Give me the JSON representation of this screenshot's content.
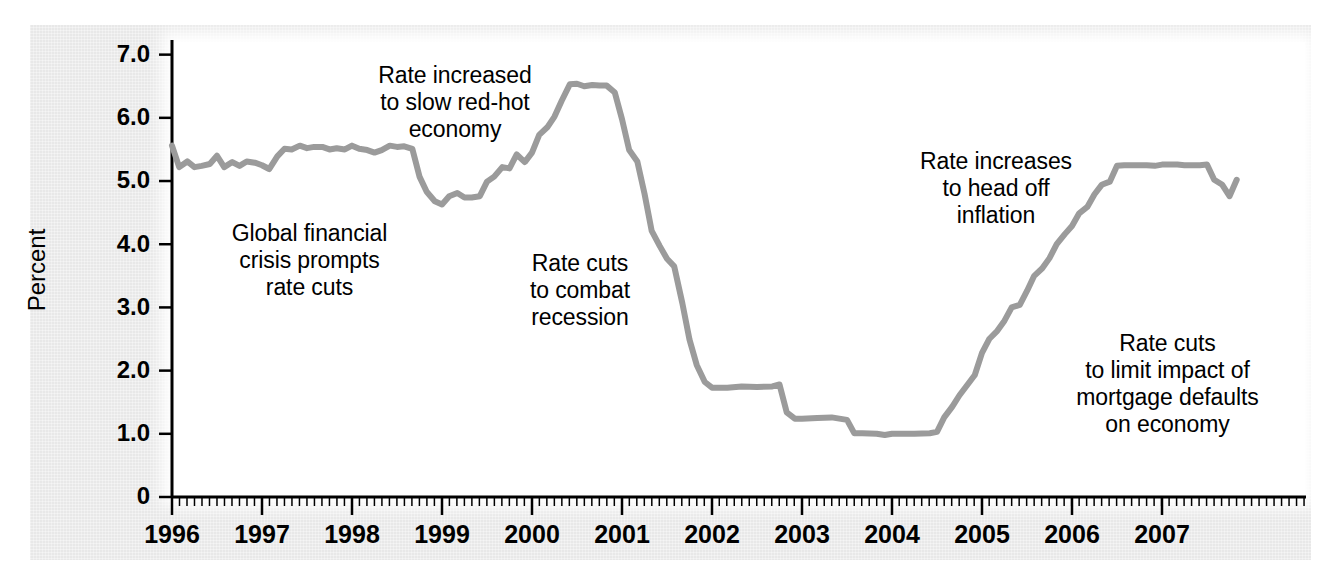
{
  "chart_data": {
    "type": "line",
    "title": "",
    "xlabel": "",
    "ylabel": "Percent",
    "ylim": [
      0,
      7.2
    ],
    "xlim": [
      1996.0,
      2008.6
    ],
    "grid": false,
    "legend": null,
    "line_color": "#9b9b9b",
    "background_color": "#e8e8e8",
    "plot_background_color": "#ffffff",
    "y_ticks": [
      "7.0",
      "6.0",
      "5.0",
      "4.0",
      "3.0",
      "2.0",
      "1.0",
      "0"
    ],
    "y_tick_values": [
      7.0,
      6.0,
      5.0,
      4.0,
      3.0,
      2.0,
      1.0,
      0
    ],
    "x_ticks": [
      "1996",
      "1997",
      "1998",
      "1999",
      "2000",
      "2001",
      "2002",
      "2003",
      "2004",
      "2005",
      "2006",
      "2007"
    ],
    "x_tick_values": [
      1996,
      1997,
      1998,
      1999,
      2000,
      2001,
      2002,
      2003,
      2004,
      2005,
      2006,
      2007
    ],
    "x_minor_tick_interval": 0.0833,
    "series": [
      {
        "name": "Federal funds rate",
        "x": [
          1996.0,
          1996.08,
          1996.17,
          1996.25,
          1996.33,
          1996.42,
          1996.5,
          1996.58,
          1996.67,
          1996.75,
          1996.83,
          1996.92,
          1997.0,
          1997.08,
          1997.17,
          1997.25,
          1997.33,
          1997.42,
          1997.5,
          1997.58,
          1997.67,
          1997.75,
          1997.83,
          1997.92,
          1998.0,
          1998.08,
          1998.17,
          1998.25,
          1998.33,
          1998.42,
          1998.5,
          1998.58,
          1998.67,
          1998.75,
          1998.83,
          1998.92,
          1999.0,
          1999.08,
          1999.17,
          1999.25,
          1999.33,
          1999.42,
          1999.5,
          1999.58,
          1999.67,
          1999.75,
          1999.83,
          1999.92,
          2000.0,
          2000.08,
          2000.17,
          2000.25,
          2000.33,
          2000.42,
          2000.5,
          2000.58,
          2000.67,
          2000.75,
          2000.83,
          2000.92,
          2001.0,
          2001.08,
          2001.17,
          2001.25,
          2001.33,
          2001.42,
          2001.5,
          2001.58,
          2001.67,
          2001.75,
          2001.83,
          2001.92,
          2002.0,
          2002.17,
          2002.33,
          2002.5,
          2002.67,
          2002.75,
          2002.83,
          2002.92,
          2003.0,
          2003.17,
          2003.33,
          2003.5,
          2003.58,
          2003.67,
          2003.83,
          2003.92,
          2004.0,
          2004.25,
          2004.42,
          2004.5,
          2004.58,
          2004.67,
          2004.75,
          2004.83,
          2004.92,
          2005.0,
          2005.08,
          2005.17,
          2005.25,
          2005.33,
          2005.42,
          2005.5,
          2005.58,
          2005.67,
          2005.75,
          2005.83,
          2005.92,
          2006.0,
          2006.08,
          2006.17,
          2006.25,
          2006.33,
          2006.42,
          2006.5,
          2006.58,
          2006.67,
          2006.75,
          2006.83,
          2006.92,
          2007.0,
          2007.08,
          2007.17,
          2007.25,
          2007.33,
          2007.42,
          2007.5,
          2007.58,
          2007.67,
          2007.75,
          2007.83
        ],
        "values": [
          5.56,
          5.22,
          5.31,
          5.22,
          5.24,
          5.27,
          5.4,
          5.22,
          5.3,
          5.24,
          5.31,
          5.29,
          5.25,
          5.19,
          5.39,
          5.51,
          5.5,
          5.56,
          5.52,
          5.54,
          5.54,
          5.5,
          5.52,
          5.5,
          5.56,
          5.51,
          5.49,
          5.45,
          5.49,
          5.56,
          5.54,
          5.55,
          5.51,
          5.07,
          4.83,
          4.68,
          4.63,
          4.76,
          4.81,
          4.74,
          4.74,
          4.76,
          4.99,
          5.07,
          5.22,
          5.2,
          5.42,
          5.3,
          5.45,
          5.73,
          5.85,
          6.02,
          6.27,
          6.53,
          6.54,
          6.5,
          6.52,
          6.51,
          6.51,
          6.4,
          5.98,
          5.49,
          5.31,
          4.8,
          4.21,
          3.97,
          3.77,
          3.65,
          3.07,
          2.49,
          2.09,
          1.82,
          1.73,
          1.73,
          1.75,
          1.74,
          1.75,
          1.78,
          1.34,
          1.24,
          1.24,
          1.25,
          1.26,
          1.22,
          1.01,
          1.01,
          1.0,
          0.98,
          1.0,
          1.0,
          1.01,
          1.03,
          1.26,
          1.43,
          1.61,
          1.76,
          1.93,
          2.28,
          2.5,
          2.63,
          2.79,
          3.0,
          3.04,
          3.26,
          3.5,
          3.62,
          3.78,
          4.0,
          4.16,
          4.29,
          4.49,
          4.59,
          4.79,
          4.94,
          4.99,
          5.24,
          5.25,
          5.25,
          5.25,
          5.25,
          5.24,
          5.26,
          5.26,
          5.26,
          5.25,
          5.25,
          5.25,
          5.26,
          5.02,
          4.94,
          4.76,
          5.02
        ]
      }
    ],
    "annotations": [
      {
        "id": "redhot",
        "text": "Rate increased\nto slow red-hot\neconomy"
      },
      {
        "id": "global",
        "text": "Global financial\ncrisis prompts\nrate cuts"
      },
      {
        "id": "recession",
        "text": "Rate cuts\nto combat\nrecession"
      },
      {
        "id": "inflation",
        "text": "Rate increases\nto head off\ninflation"
      },
      {
        "id": "mortgage",
        "text": "Rate cuts\nto limit impact of\nmortgage defaults\non economy"
      }
    ]
  }
}
